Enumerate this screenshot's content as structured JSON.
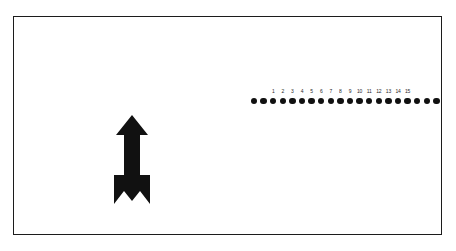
{
  "figure": {
    "background_color": "#ffffff",
    "ink_color": "#111111",
    "frame": {
      "name": "figure-border",
      "border_color": "#1c1c1c",
      "border_width_px": 1.6
    },
    "arrow": {
      "label": "up-arrow",
      "direction": "up",
      "description": "solid black arrow pointing upward with notched fletching at the tail",
      "fill_color": "#111111"
    },
    "dot_row": {
      "label": "row of filled dots",
      "dot_count": 20,
      "dot_color": "#111111",
      "dot_diameter_px": 6.4,
      "spacing_px": 9.6,
      "numbered_labels": [
        "1",
        "2",
        "3",
        "4",
        "5",
        "6",
        "7",
        "8",
        "9",
        "10",
        "11",
        "12",
        "13",
        "14",
        "15"
      ],
      "label_start_index": 2,
      "label_color": "#2a2a2a"
    }
  },
  "chart_data": {
    "type": "scatter",
    "title": "",
    "xlabel": "",
    "ylabel": "",
    "categories": [
      "1",
      "2",
      "3",
      "4",
      "5",
      "6",
      "7",
      "8",
      "9",
      "10",
      "11",
      "12",
      "13",
      "14",
      "15"
    ],
    "x": [
      1,
      2,
      3,
      4,
      5,
      6,
      7,
      8,
      9,
      10,
      11,
      12,
      13,
      14,
      15
    ],
    "values": [
      1,
      1,
      1,
      1,
      1,
      1,
      1,
      1,
      1,
      1,
      1,
      1,
      1,
      1,
      1
    ],
    "series": [
      {
        "name": "dot-row",
        "values": [
          1,
          1,
          1,
          1,
          1,
          1,
          1,
          1,
          1,
          1,
          1,
          1,
          1,
          1,
          1
        ]
      }
    ],
    "total_markers": 20,
    "unlabeled_leading_markers": 2,
    "unlabeled_trailing_markers": 3,
    "grid": false,
    "legend": "none",
    "marker": "filled-circle",
    "annotations": [
      "up-arrow"
    ]
  }
}
